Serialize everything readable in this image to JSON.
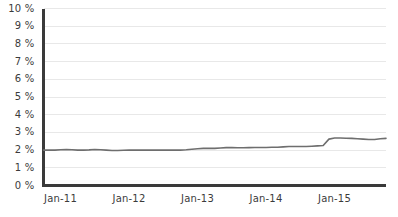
{
  "chart_data": {
    "type": "line",
    "title": "",
    "subtitle": "",
    "xlabel": "",
    "ylabel": "",
    "grid": true,
    "legend": false,
    "legend_position": "none",
    "line_color": "#6e6e6e",
    "axis_color": "#3a3a3a",
    "grid_color": "#e8e8e8",
    "background_color": "#ffffff",
    "ylim": [
      0,
      10
    ],
    "y_tick_labels": [
      "10 %",
      "9 %",
      "8 %",
      "7 %",
      "6 %",
      "5 %",
      "4 %",
      "3 %",
      "2 %",
      "1 %",
      "0 %"
    ],
    "y_tick_values": [
      10,
      9,
      8,
      7,
      6,
      5,
      4,
      3,
      2,
      1,
      0
    ],
    "x_tick_labels": [
      "Jan-11",
      "Jan-12",
      "Jan-13",
      "Jan-14",
      "Jan-15"
    ],
    "x_tick_values": [
      0,
      12,
      24,
      36,
      48
    ],
    "xlim": [
      0,
      60
    ],
    "series": [
      {
        "name": "Rate",
        "x": [
          0,
          1,
          2,
          3,
          4,
          5,
          6,
          7,
          8,
          9,
          10,
          11,
          12,
          13,
          14,
          15,
          16,
          17,
          18,
          19,
          20,
          21,
          22,
          23,
          24,
          25,
          26,
          27,
          28,
          29,
          30,
          31,
          32,
          33,
          34,
          35,
          36,
          37,
          38,
          39,
          40,
          41,
          42,
          43,
          44,
          45,
          46,
          47,
          48,
          49,
          50,
          51,
          52,
          53,
          54,
          55,
          56,
          57,
          58,
          59,
          60
        ],
        "values": [
          2.0,
          2.0,
          2.0,
          2.02,
          2.03,
          2.02,
          2.0,
          2.0,
          2.01,
          2.03,
          2.02,
          2.0,
          1.98,
          1.98,
          1.99,
          2.0,
          2.0,
          2.0,
          2.0,
          2.0,
          2.0,
          2.0,
          2.0,
          2.0,
          2.0,
          2.02,
          2.05,
          2.08,
          2.1,
          2.1,
          2.1,
          2.12,
          2.14,
          2.14,
          2.13,
          2.13,
          2.14,
          2.15,
          2.15,
          2.15,
          2.16,
          2.16,
          2.18,
          2.2,
          2.2,
          2.2,
          2.2,
          2.22,
          2.24,
          2.26,
          2.62,
          2.68,
          2.68,
          2.67,
          2.66,
          2.64,
          2.62,
          2.6,
          2.6,
          2.64,
          2.66
        ]
      }
    ]
  }
}
